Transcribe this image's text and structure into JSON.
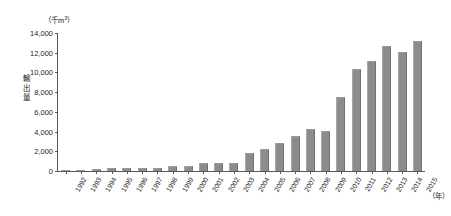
{
  "chart_data": {
    "type": "bar",
    "title": "",
    "subtitle": "",
    "unit_label": "（千m³）",
    "unit_label_base": "（千m",
    "unit_label_sup": "3",
    "unit_label_tail": "）",
    "ylabel": "輸出量",
    "ylabel_chars": [
      "輸",
      "出",
      "量"
    ],
    "xlabel": "（年）",
    "grid": false,
    "legend": "none",
    "ylim": [
      0,
      14000
    ],
    "yticks": [
      0,
      2000,
      4000,
      6000,
      8000,
      10000,
      12000,
      14000
    ],
    "ytick_labels": [
      "0",
      "2,000",
      "4,000",
      "6,000",
      "8,000",
      "10,000",
      "12,000",
      "14,000"
    ],
    "categories": [
      "1992",
      "1993",
      "1994",
      "1995",
      "1996",
      "1997",
      "1998",
      "1999",
      "2000",
      "2001",
      "2002",
      "2003",
      "2004",
      "2005",
      "2006",
      "2007",
      "2008",
      "2009",
      "2010",
      "2011",
      "2012",
      "2013",
      "2014",
      "2015"
    ],
    "values": [
      60,
      80,
      180,
      280,
      300,
      300,
      320,
      480,
      500,
      780,
      800,
      820,
      1800,
      2250,
      2850,
      3550,
      4250,
      4100,
      7500,
      10300,
      11200,
      12700,
      12100,
      13200
    ],
    "bar_color": "#8c8c8c",
    "axis_color": "#58595b",
    "text_color": "#231f20",
    "background_color": "#ffffff"
  }
}
